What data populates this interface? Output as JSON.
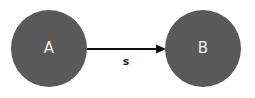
{
  "diagram": {
    "type": "directed-graph",
    "colors": {
      "node_fill": "#595959",
      "node_text": "#ececec",
      "edge": "#111111",
      "edge_label": "#1a1a1a",
      "background": "#ffffff"
    },
    "nodes": [
      {
        "id": "A",
        "label": "A",
        "cx": 49,
        "cy": 49,
        "r": 38
      },
      {
        "id": "B",
        "label": "B",
        "cx": 203,
        "cy": 49,
        "r": 38
      }
    ],
    "edges": [
      {
        "from": "A",
        "to": "B",
        "label": "s",
        "directed": true
      }
    ]
  }
}
